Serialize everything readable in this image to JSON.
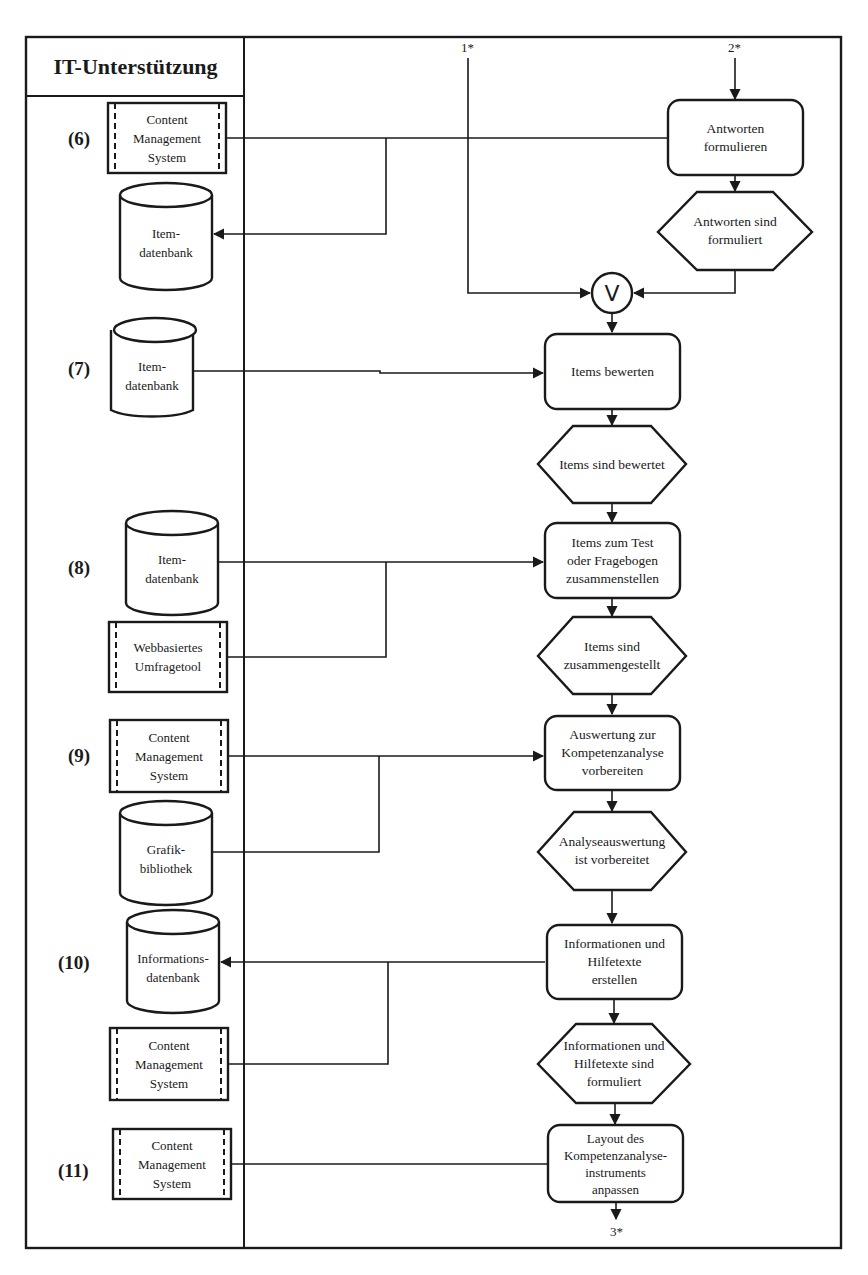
{
  "header": {
    "lane_title": "IT-Unterstützung"
  },
  "connectors": {
    "in_1": "1*",
    "in_2": "2*",
    "out_3": "3*",
    "merge_symbol": "V"
  },
  "sections": [
    {
      "id": "6",
      "label": "(6)",
      "it_systems": [
        {
          "type": "system",
          "label": "Content\nManagement\nSystem"
        },
        {
          "type": "database",
          "label": "Item-\ndatenbank"
        }
      ],
      "process": "Antworten\nformulieren",
      "event": "Antworten sind\nformuliert"
    },
    {
      "id": "7",
      "label": "(7)",
      "it_systems": [
        {
          "type": "database",
          "label": "Item-\ndatenbank"
        }
      ],
      "process": "Items bewerten",
      "event": "Items sind bewertet"
    },
    {
      "id": "8",
      "label": "(8)",
      "it_systems": [
        {
          "type": "database",
          "label": "Item-\ndatenbank"
        },
        {
          "type": "system",
          "label": "Webbasiertes\nUmfragetool"
        }
      ],
      "process": "Items zum Test\noder Fragebogen\nzusammenstellen",
      "event": "Items sind\nzusammengestellt"
    },
    {
      "id": "9",
      "label": "(9)",
      "it_systems": [
        {
          "type": "system",
          "label": "Content\nManagement\nSystem"
        },
        {
          "type": "database",
          "label": "Grafik-\nbibliothek"
        }
      ],
      "process": "Auswertung zur\nKompetenzanalyse\nvorbereiten",
      "event": "Analyseauswertung\nist vorbereitet"
    },
    {
      "id": "10",
      "label": "(10)",
      "it_systems": [
        {
          "type": "database",
          "label": "Informations-\ndatenbank"
        },
        {
          "type": "system",
          "label": "Content\nManagement\nSystem"
        }
      ],
      "process": "Informationen und\nHilfetexte\nerstellen",
      "event": "Informationen und\nHilfetexte sind\nformuliert"
    },
    {
      "id": "11",
      "label": "(11)",
      "it_systems": [
        {
          "type": "system",
          "label": "Content\nManagement\nSystem"
        }
      ],
      "process": "Layout des\nKompetenzanalyse-\ninstruments\nanpassen",
      "event": null
    }
  ],
  "colors": {
    "ink": "#1a1a1a",
    "paper": "#ffffff"
  }
}
